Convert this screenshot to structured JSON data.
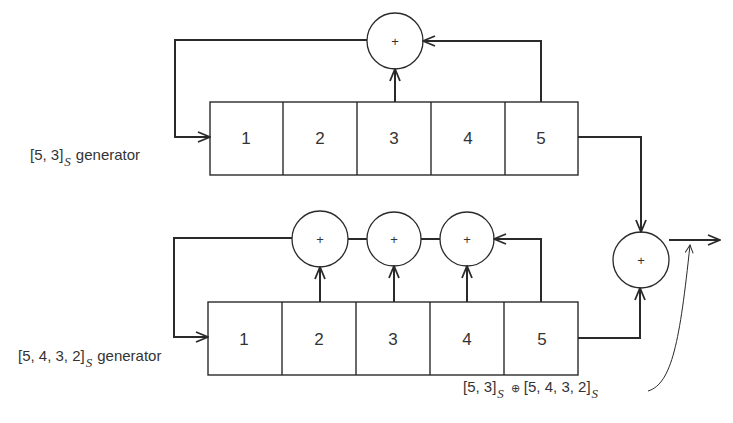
{
  "diagram": {
    "top_generator": {
      "label_main": "[5, 3]",
      "label_sub": "S",
      "label_suffix": "generator",
      "cells": [
        "1",
        "2",
        "3",
        "4",
        "5"
      ],
      "taps": [
        3,
        5
      ],
      "adder_symbol": "+"
    },
    "bottom_generator": {
      "label_main": "[5, 4, 3, 2]",
      "label_sub": "S",
      "label_suffix": "generator",
      "cells": [
        "1",
        "2",
        "3",
        "4",
        "5"
      ],
      "taps": [
        2,
        3,
        4,
        5
      ],
      "adder_symbols": [
        "+",
        "+",
        "+"
      ]
    },
    "combiner": {
      "adder_symbol": "+",
      "output_label": {
        "part1": "[5, 3]",
        "sub1": "S",
        "operator": "⊕",
        "part2": "[5, 4, 3, 2]",
        "sub2": "S"
      }
    }
  }
}
